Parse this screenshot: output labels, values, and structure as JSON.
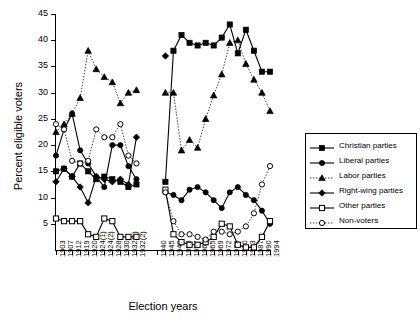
{
  "chart_data": {
    "type": "line",
    "title": "",
    "xlabel": "Election years",
    "ylabel": "Percent eligible voters",
    "ylim": [
      0,
      45
    ],
    "yticks": [
      5,
      10,
      15,
      20,
      25,
      30,
      35,
      40,
      45
    ],
    "grid": false,
    "legend_position": "right",
    "axis_break": true,
    "categories": [
      "1903",
      "1907",
      "1912",
      "1919",
      "1920",
      "1924(1)",
      "1924(2)",
      "1928",
      "1930",
      "1932(1)",
      "1932(2)",
      "1940",
      "1945",
      "1949",
      "1953",
      "1957",
      "1961",
      "1965",
      "1969",
      "1972",
      "1976",
      "1980",
      "1983",
      "1987",
      "1990",
      "1994"
    ],
    "series": [
      {
        "name": "Christian parties",
        "marker": "filled-square",
        "line": "solid",
        "values": [
          15.0,
          15.5,
          14.0,
          16.5,
          15.0,
          13.5,
          14.0,
          13.5,
          13.0,
          12.0,
          12.5,
          null,
          13.0,
          38.0,
          41.0,
          39.5,
          39.0,
          39.5,
          39.0,
          40.5,
          43.0,
          37.5,
          42.0,
          38.0,
          34.0,
          34.0
        ]
      },
      {
        "name": "Liberal parties",
        "marker": "filled-circle",
        "line": "solid",
        "values": [
          18.0,
          23.0,
          26.0,
          19.0,
          16.5,
          14.0,
          12.0,
          20.0,
          20.0,
          16.0,
          13.5,
          null,
          11.0,
          10.5,
          9.5,
          11.5,
          12.0,
          11.0,
          9.5,
          8.0,
          11.0,
          12.0,
          10.5,
          9.5,
          7.5,
          5.0
        ]
      },
      {
        "name": "Labor parties",
        "marker": "filled-triangle",
        "line": "dotted",
        "values": [
          22.5,
          24.0,
          26.0,
          29.0,
          38.0,
          34.5,
          33.0,
          32.0,
          28.0,
          30.0,
          30.5,
          null,
          30.0,
          30.0,
          19.0,
          21.0,
          19.5,
          25.0,
          29.5,
          33.5,
          39.5,
          40.0,
          35.5,
          32.5,
          30.0,
          26.5
        ]
      },
      {
        "name": "Right-wing parties",
        "marker": "filled-diamond",
        "line": "solid",
        "values": [
          13.0,
          15.5,
          14.0,
          12.0,
          9.0,
          14.0,
          13.5,
          13.0,
          13.5,
          12.5,
          21.5,
          null,
          37.0,
          null,
          null,
          null,
          null,
          null,
          null,
          null,
          null,
          null,
          null,
          null,
          null,
          null
        ]
      },
      {
        "name": "Other parties",
        "marker": "open-square",
        "line": "solid",
        "values": [
          6.0,
          5.5,
          5.5,
          5.5,
          3.0,
          2.5,
          6.0,
          5.5,
          2.5,
          2.5,
          2.5,
          null,
          11.5,
          3.0,
          1.5,
          1.0,
          1.0,
          1.5,
          2.5,
          5.0,
          4.5,
          1.0,
          0.5,
          0.5,
          2.5,
          5.5
        ]
      },
      {
        "name": "Non-voters",
        "marker": "open-circle",
        "line": "dotted",
        "values": [
          24.0,
          23.0,
          17.0,
          16.5,
          17.0,
          23.0,
          21.5,
          21.5,
          24.0,
          18.0,
          16.5,
          null,
          11.0,
          5.5,
          3.0,
          3.0,
          2.5,
          2.0,
          3.5,
          3.5,
          3.0,
          3.5,
          4.5,
          7.0,
          12.5,
          16.0
        ]
      }
    ]
  },
  "legend": {
    "items": [
      {
        "label": "Christian parties"
      },
      {
        "label": "Liberal parties"
      },
      {
        "label": "Labor parties"
      },
      {
        "label": "Right-wing parties"
      },
      {
        "label": "Other parties"
      },
      {
        "label": "Non-voters"
      }
    ]
  },
  "colors": {
    "ink": "#000000",
    "background": "#ffffff"
  }
}
